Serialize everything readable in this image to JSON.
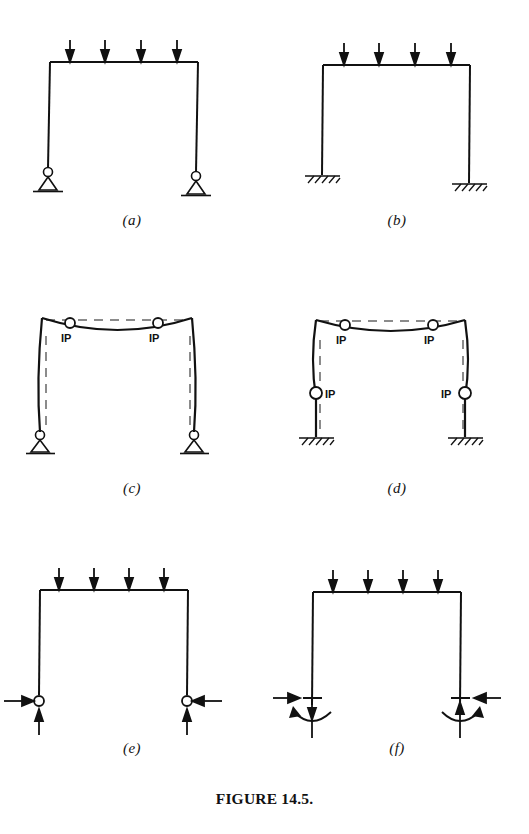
{
  "figure": {
    "title": "FIGURE 14.5."
  },
  "panels": [
    {
      "id": "a",
      "caption": "(a)",
      "description": "Portal frame with uniform downward load on beam, pinned supports at both column bases",
      "support_type": "pin",
      "load_arrows": 4,
      "ip_labels": []
    },
    {
      "id": "b",
      "caption": "(b)",
      "description": "Portal frame with uniform downward load on beam, fixed supports at both column bases",
      "support_type": "fixed",
      "load_arrows": 4,
      "ip_labels": []
    },
    {
      "id": "c",
      "caption": "(c)",
      "description": "Deflected shape of pin-based frame, dashed undeformed outline, two inflection points on beam",
      "support_type": "pin",
      "load_arrows": 0,
      "ip_labels": [
        "IP",
        "IP"
      ]
    },
    {
      "id": "d",
      "caption": "(d)",
      "description": "Deflected shape of fixed-based frame, dashed undeformed outline, two inflection points on beam and one on each column",
      "support_type": "fixed",
      "load_arrows": 0,
      "ip_labels": [
        "IP",
        "IP",
        "IP",
        "IP"
      ]
    },
    {
      "id": "e",
      "caption": "(e)",
      "description": "Free body of pin-based frame showing horizontal thrust and vertical reaction at each hinge",
      "support_type": "hinge-reaction",
      "load_arrows": 4,
      "ip_labels": []
    },
    {
      "id": "f",
      "caption": "(f)",
      "description": "Free body of fixed-based frame showing horizontal thrust, vertical reaction and end moment at each base",
      "support_type": "moment-reaction",
      "load_arrows": 4,
      "ip_labels": []
    }
  ],
  "ip_label_text": "IP",
  "colors": {
    "ink": "#111111",
    "background": "#ffffff",
    "dashed": "#555555"
  }
}
